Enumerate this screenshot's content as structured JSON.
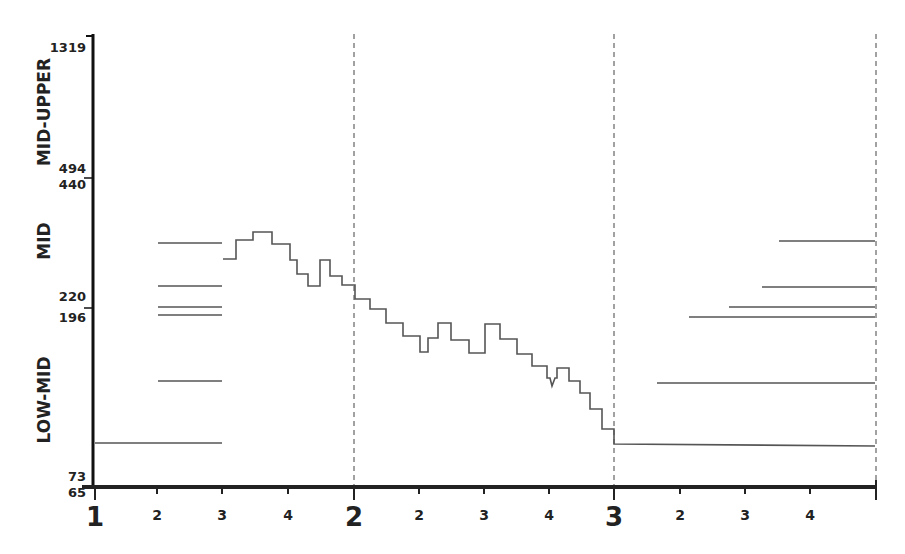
{
  "chart_data": {
    "type": "line",
    "title": "",
    "xlabel": "",
    "ylabel": "",
    "y_axis": {
      "scale": "nonlinear-banded",
      "tick_labels": [
        "1319",
        "494",
        "440",
        "220",
        "196",
        "73",
        "65"
      ],
      "bands": [
        {
          "name": "MID-UPPER",
          "range": [
            494,
            1319
          ]
        },
        {
          "name": "MID",
          "range": [
            220,
            440
          ]
        },
        {
          "name": "LOW-MID",
          "range": [
            73,
            196
          ]
        }
      ]
    },
    "x_axis": {
      "major_ticks": [
        "1",
        "2",
        "3"
      ],
      "minor_ticks_per_section": [
        "2",
        "3",
        "4"
      ],
      "tick_labels": [
        "1",
        "2",
        "3",
        "4",
        "2",
        "2",
        "3",
        "4",
        "3",
        "2",
        "3",
        "4"
      ],
      "section_dividers": [
        "2",
        "3",
        "end"
      ]
    },
    "series": [
      {
        "name": "step-trace",
        "style": "step",
        "pixel_points": [
          [
            223,
            259
          ],
          [
            236,
            259
          ],
          [
            236,
            240
          ],
          [
            253,
            240
          ],
          [
            253,
            232
          ],
          [
            272,
            232
          ],
          [
            272,
            244
          ],
          [
            290,
            244
          ],
          [
            290,
            260
          ],
          [
            297,
            260
          ],
          [
            297,
            274
          ],
          [
            308,
            274
          ],
          [
            308,
            286
          ],
          [
            320,
            286
          ],
          [
            320,
            260
          ],
          [
            330,
            260
          ],
          [
            330,
            276
          ],
          [
            342,
            276
          ],
          [
            342,
            285
          ],
          [
            355,
            285
          ],
          [
            355,
            299
          ],
          [
            370,
            299
          ],
          [
            370,
            309
          ],
          [
            386,
            309
          ],
          [
            386,
            323
          ],
          [
            403,
            323
          ],
          [
            403,
            336
          ],
          [
            420,
            336
          ],
          [
            420,
            352
          ],
          [
            428,
            352
          ],
          [
            428,
            338
          ],
          [
            438,
            338
          ],
          [
            438,
            323
          ],
          [
            451,
            323
          ],
          [
            451,
            340
          ],
          [
            469,
            340
          ],
          [
            469,
            353
          ],
          [
            485,
            353
          ],
          [
            485,
            324
          ],
          [
            500,
            324
          ],
          [
            500,
            339
          ],
          [
            517,
            339
          ],
          [
            517,
            354
          ],
          [
            532,
            354
          ],
          [
            532,
            366
          ],
          [
            547,
            366
          ],
          [
            547,
            378
          ],
          [
            550,
            378
          ],
          [
            552,
            386
          ],
          [
            555,
            378
          ],
          [
            557,
            378
          ],
          [
            557,
            368
          ],
          [
            569,
            368
          ],
          [
            569,
            381
          ],
          [
            580,
            381
          ],
          [
            580,
            393
          ],
          [
            590,
            393
          ],
          [
            590,
            409
          ],
          [
            602,
            409
          ],
          [
            602,
            429
          ],
          [
            614,
            429
          ],
          [
            614,
            444
          ],
          [
            875,
            446
          ]
        ]
      }
    ],
    "reference_lines_left": [
      {
        "y_px": 243,
        "x_from": 158,
        "x_to": 222
      },
      {
        "y_px": 286,
        "x_from": 158,
        "x_to": 222
      },
      {
        "y_px": 307,
        "x_from": 158,
        "x_to": 222
      },
      {
        "y_px": 315,
        "x_from": 158,
        "x_to": 222
      },
      {
        "y_px": 381,
        "x_from": 158,
        "x_to": 222
      },
      {
        "y_px": 443,
        "x_from": 95,
        "x_to": 222
      }
    ],
    "reference_lines_right": [
      {
        "y_px": 241,
        "x_from": 779,
        "x_to": 875
      },
      {
        "y_px": 287,
        "x_from": 762,
        "x_to": 875
      },
      {
        "y_px": 307,
        "x_from": 729,
        "x_to": 875
      },
      {
        "y_px": 317,
        "x_from": 689,
        "x_to": 875
      },
      {
        "y_px": 383,
        "x_from": 657,
        "x_to": 875
      }
    ],
    "grid": false,
    "legend": null
  },
  "axis": {
    "y_ticks": [
      {
        "label": "1319",
        "y": 52
      },
      {
        "label": "494",
        "y": 173
      },
      {
        "label": "440",
        "y": 189
      },
      {
        "label": "220",
        "y": 301
      },
      {
        "label": "196",
        "y": 322
      },
      {
        "label": "73",
        "y": 481
      },
      {
        "label": "65",
        "y": 497
      }
    ],
    "bands": [
      {
        "label": "MID-UPPER",
        "cy": 112
      },
      {
        "label": "MID",
        "cy": 241
      },
      {
        "label": "LOW-MID",
        "cy": 400
      }
    ],
    "x_ticks": [
      {
        "label": "1",
        "x": 95,
        "major": true
      },
      {
        "label": "2",
        "x": 157,
        "major": false
      },
      {
        "label": "3",
        "x": 222,
        "major": false
      },
      {
        "label": "4",
        "x": 288,
        "major": false
      },
      {
        "label": "2",
        "x": 354,
        "major": true
      },
      {
        "label": "2",
        "x": 419,
        "major": false
      },
      {
        "label": "3",
        "x": 484,
        "major": false
      },
      {
        "label": "4",
        "x": 549,
        "major": false
      },
      {
        "label": "3",
        "x": 614,
        "major": true
      },
      {
        "label": "2",
        "x": 680,
        "major": false
      },
      {
        "label": "3",
        "x": 745,
        "major": false
      },
      {
        "label": "4",
        "x": 810,
        "major": false
      }
    ],
    "dividers_x": [
      354,
      614,
      876
    ]
  }
}
